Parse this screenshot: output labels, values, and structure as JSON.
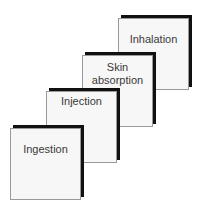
{
  "diagram": {
    "top_partial_text": "...",
    "steps": [
      {
        "label": "Ingestion",
        "order": 1
      },
      {
        "label": "Injection",
        "order": 2
      },
      {
        "label": "Skin\nabsorption",
        "label_line1": "Skin",
        "label_line2": "absorption",
        "order": 3
      },
      {
        "label": "Inhalation",
        "order": 4
      }
    ],
    "colors": {
      "face": "#f7f7f7",
      "shadow": "#111111",
      "border": "#9a9a9a",
      "text": "#3a3a3a"
    }
  }
}
